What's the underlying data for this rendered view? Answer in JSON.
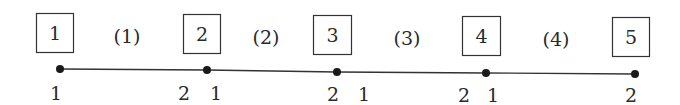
{
  "diagram": {
    "type": "1D beam/bar element discretization",
    "elements": [
      {
        "label": "(1)",
        "x": 127,
        "y": 37
      },
      {
        "label": "(2)",
        "x": 266,
        "y": 38
      },
      {
        "label": "(3)",
        "x": 407,
        "y": 39
      },
      {
        "label": "(4)",
        "x": 556,
        "y": 40
      }
    ],
    "nodes": [
      {
        "id": "1",
        "box": {
          "x": 36,
          "y": 13,
          "w": 37,
          "h": 39
        },
        "dot": {
          "x": 60,
          "y": 69
        }
      },
      {
        "id": "2",
        "box": {
          "x": 183,
          "y": 14,
          "w": 37,
          "h": 39
        },
        "dot": {
          "x": 207,
          "y": 70
        }
      },
      {
        "id": "3",
        "box": {
          "x": 313,
          "y": 15,
          "w": 38,
          "h": 39
        },
        "dot": {
          "x": 337,
          "y": 72
        }
      },
      {
        "id": "4",
        "box": {
          "x": 462,
          "y": 16,
          "w": 38,
          "h": 39
        },
        "dot": {
          "x": 486,
          "y": 73
        }
      },
      {
        "id": "5",
        "box": {
          "x": 612,
          "y": 17,
          "w": 37,
          "h": 39
        },
        "dot": {
          "x": 635,
          "y": 74
        }
      }
    ],
    "local_node_labels": [
      {
        "text": "1",
        "x": 56,
        "y": 100
      },
      {
        "text": "2",
        "x": 184,
        "y": 100
      },
      {
        "text": "1",
        "x": 216,
        "y": 100
      },
      {
        "text": "2",
        "x": 333,
        "y": 101
      },
      {
        "text": "1",
        "x": 364,
        "y": 101
      },
      {
        "text": "2",
        "x": 464,
        "y": 102
      },
      {
        "text": "1",
        "x": 493,
        "y": 102
      },
      {
        "text": "2",
        "x": 631,
        "y": 102
      }
    ],
    "colors": {
      "line": "#333333",
      "dot": "#1a1a1a",
      "box_stroke": "#333333",
      "text": "#2a2a2a"
    }
  }
}
